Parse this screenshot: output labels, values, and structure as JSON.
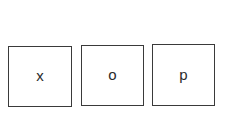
{
  "tiles": [
    {
      "label": "x"
    },
    {
      "label": "o"
    },
    {
      "label": "p"
    }
  ],
  "colors": {
    "background": "#ffffff",
    "border": "#3a3a3a",
    "text": "#2b2b2b"
  }
}
